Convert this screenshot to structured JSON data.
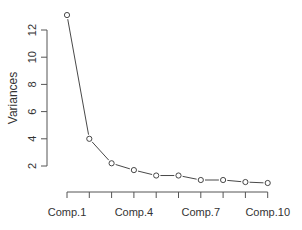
{
  "chart_data": {
    "type": "line",
    "title": "",
    "xlabel": "",
    "ylabel": "Variances",
    "categories": [
      "Comp.1",
      "Comp.2",
      "Comp.3",
      "Comp.4",
      "Comp.5",
      "Comp.6",
      "Comp.7",
      "Comp.8",
      "Comp.9",
      "Comp.10"
    ],
    "values": [
      13.1,
      4.0,
      2.2,
      1.7,
      1.3,
      1.3,
      0.97,
      0.97,
      0.82,
      0.75
    ],
    "x_tick_labels_shown": [
      "Comp.1",
      "Comp.4",
      "Comp.7",
      "Comp.10"
    ],
    "y_ticks": [
      2,
      4,
      6,
      8,
      10,
      12
    ],
    "ylim": [
      0.75,
      13.1
    ],
    "grid": false,
    "legend": null,
    "marker": "open-circle",
    "line_color": "#333333"
  }
}
